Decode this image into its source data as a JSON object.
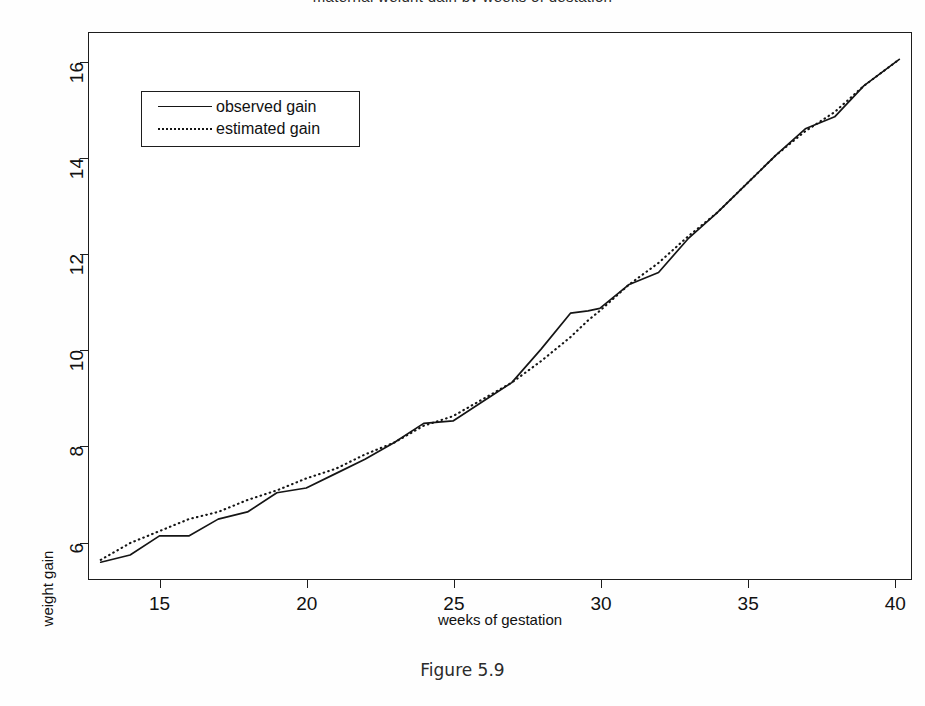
{
  "figure": {
    "caption": "Figure 5.9",
    "clipped_title": "maternal weight gain by weeks of gestation"
  },
  "chart_data": {
    "type": "line",
    "title": "",
    "xlabel": "weeks of gestation",
    "ylabel": "weight gain",
    "xlim": [
      12.6,
      40.6
    ],
    "ylim": [
      5.2,
      16.6
    ],
    "xticks": [
      15,
      20,
      25,
      30,
      35,
      40
    ],
    "yticks": [
      6,
      8,
      10,
      12,
      14,
      16
    ],
    "xtick_labels": [
      "15",
      "20",
      "25",
      "30",
      "35",
      "40"
    ],
    "ytick_labels": [
      "6",
      "8",
      "10",
      "12",
      "14",
      "16"
    ],
    "grid": false,
    "legend_position": "top-left",
    "x": [
      13,
      14,
      15,
      16,
      17,
      18,
      19,
      20,
      21,
      22,
      23,
      24,
      25,
      26,
      27,
      28,
      29,
      29.6,
      30,
      31,
      32,
      33,
      34,
      35,
      36,
      37,
      38,
      39,
      40.2
    ],
    "series": [
      {
        "name": "observed gain",
        "style": "solid",
        "color": "#151515",
        "values": [
          5.55,
          5.7,
          6.1,
          6.1,
          6.45,
          6.6,
          7.0,
          7.1,
          7.4,
          7.7,
          8.05,
          8.45,
          8.5,
          8.9,
          9.3,
          10.0,
          10.75,
          10.8,
          10.85,
          11.35,
          11.6,
          12.3,
          12.85,
          13.45,
          14.05,
          14.6,
          14.85,
          15.5,
          16.05
        ]
      },
      {
        "name": "estimated gain",
        "style": "dotted",
        "color": "#151515",
        "values": [
          5.6,
          5.95,
          6.2,
          6.45,
          6.6,
          6.85,
          7.05,
          7.3,
          7.5,
          7.8,
          8.05,
          8.4,
          8.6,
          8.95,
          9.3,
          9.75,
          10.25,
          10.6,
          10.8,
          11.35,
          11.8,
          12.35,
          12.85,
          13.45,
          14.05,
          14.55,
          14.95,
          15.5,
          16.05
        ]
      }
    ],
    "legend": [
      "observed gain",
      "estimated gain"
    ]
  }
}
